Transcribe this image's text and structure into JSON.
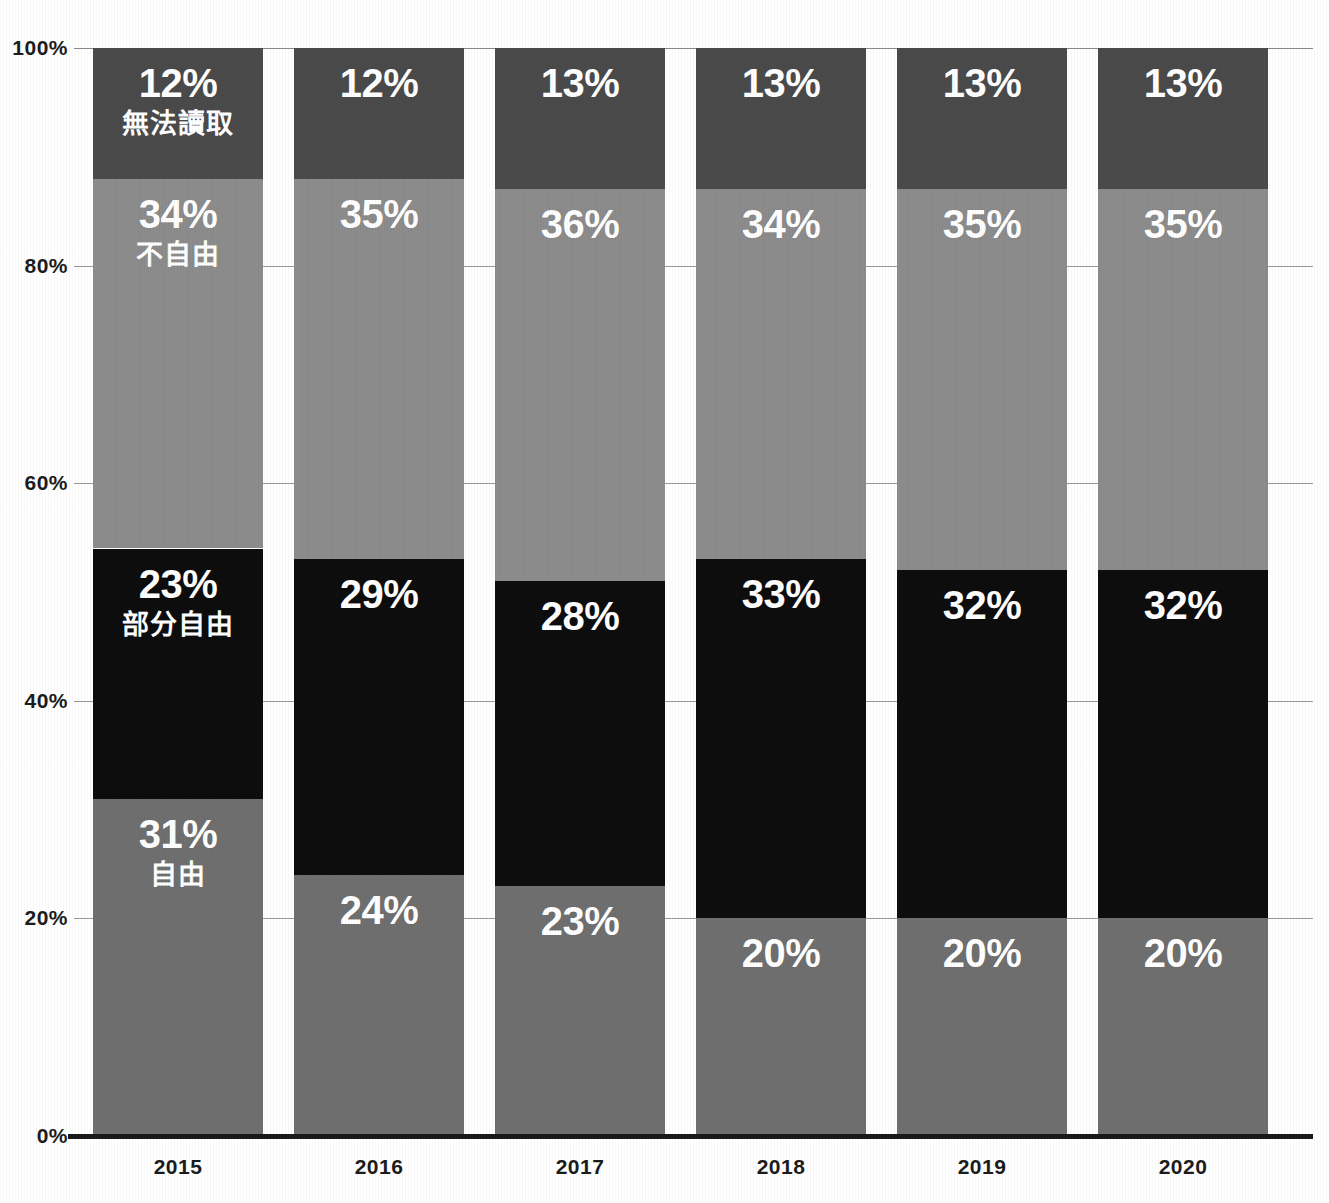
{
  "chart_data": {
    "type": "bar",
    "subtype": "stacked-100-percent",
    "title": "",
    "xlabel": "",
    "ylabel": "",
    "ylim": [
      0,
      100
    ],
    "ytick_labels": [
      "100%",
      "80%",
      "60%",
      "40%",
      "20%",
      "0%"
    ],
    "ytick_values": [
      100,
      80,
      60,
      40,
      20,
      0
    ],
    "grid": true,
    "legend_position": "in-bar-first-column",
    "categories": [
      "2015",
      "2016",
      "2017",
      "2018",
      "2019",
      "2020"
    ],
    "series": [
      {
        "name": "無法讀取",
        "key": "not-readable",
        "color": "#4a4a4a",
        "stack_order": 3,
        "values": [
          12,
          12,
          13,
          13,
          13,
          13
        ],
        "labels": [
          "12%",
          "12%",
          "13%",
          "13%",
          "13%",
          "13%"
        ]
      },
      {
        "name": "不自由",
        "key": "not-free",
        "color": "#8c8c8c",
        "stack_order": 2,
        "values": [
          34,
          35,
          36,
          34,
          35,
          35
        ],
        "labels": [
          "34%",
          "35%",
          "36%",
          "34%",
          "35%",
          "35%"
        ]
      },
      {
        "name": "部分自由",
        "key": "partly-free",
        "color": "#0d0d0d",
        "stack_order": 1,
        "values": [
          23,
          29,
          28,
          33,
          32,
          32
        ],
        "labels": [
          "23%",
          "29%",
          "28%",
          "33%",
          "32%",
          "32%"
        ]
      },
      {
        "name": "自由",
        "key": "free",
        "color": "#6f6f6f",
        "stack_order": 0,
        "values": [
          31,
          24,
          23,
          20,
          20,
          20
        ],
        "labels": [
          "31%",
          "24%",
          "23%",
          "20%",
          "20%",
          "20%"
        ]
      }
    ],
    "series_name_shown_on_column": "2015",
    "colors": {
      "not_readable": "#4a4a4a",
      "not_free": "#8c8c8c",
      "partly_free": "#0d0d0d",
      "free": "#6f6f6f",
      "axis": "#1a1a1a",
      "gridline": "#9b9b9b",
      "label_text": "#ffffff",
      "tick_text": "#1c1c1c",
      "background": "#ffffff"
    }
  }
}
